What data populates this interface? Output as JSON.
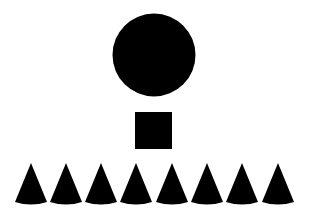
{
  "background": "#ffffff",
  "fill": "#000000",
  "circle": {
    "cx": 154,
    "cy": 55,
    "r": 41.5
  },
  "square": {
    "x": 135,
    "y": 112,
    "size": 37
  },
  "cones": {
    "count": 8,
    "apex_y": 163,
    "base_y": 202,
    "half_width": 16,
    "sag": 2.5,
    "apex_x": [
      31,
      66,
      101,
      136,
      172,
      207,
      242,
      278
    ]
  }
}
